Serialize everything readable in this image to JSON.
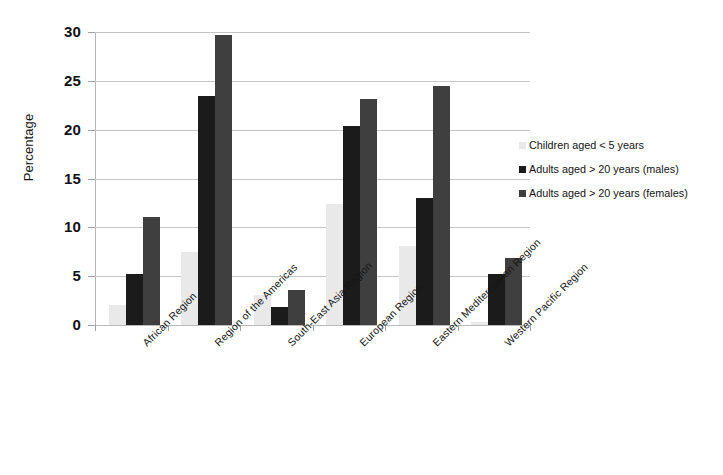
{
  "chart_data": {
    "type": "bar",
    "title": "",
    "xlabel": "",
    "ylabel": "Percentage",
    "ylim": [
      0,
      30
    ],
    "yticks": [
      0,
      5,
      10,
      15,
      20,
      25,
      30
    ],
    "grid": true,
    "legend_position": "right",
    "categories": [
      "African Region",
      "Region of the Americas",
      "South-East Asia Region",
      "European Region",
      "Eastern Mediterranean Region",
      "Western Pacific Region"
    ],
    "series": [
      {
        "name": "Children aged < 5 years",
        "color": "#e9e9e9",
        "values": [
          2.0,
          7.5,
          3.1,
          12.4,
          8.1,
          0.3
        ]
      },
      {
        "name": "Adults aged > 20 years (males)",
        "color": "#1b1b1b",
        "values": [
          5.2,
          23.4,
          1.8,
          20.4,
          13.0,
          5.2
        ]
      },
      {
        "name": "Adults aged > 20 years (females)",
        "color": "#3f3f3f",
        "values": [
          11.1,
          29.7,
          3.6,
          23.1,
          24.5,
          6.9
        ]
      }
    ]
  },
  "axes": {
    "y_title": "Percentage",
    "y_tick_labels": [
      "0",
      "5",
      "10",
      "15",
      "20",
      "25",
      "30"
    ]
  },
  "legend": {
    "entries": [
      {
        "label": "Children aged < 5 years",
        "swatch": "s-children"
      },
      {
        "label": "Adults aged > 20 years (males)",
        "swatch": "s-males"
      },
      {
        "label": "Adults aged > 20 years (females)",
        "swatch": "s-females"
      }
    ]
  },
  "colors": {
    "children": "#e9e9e9",
    "males": "#1b1b1b",
    "females": "#3f3f3f",
    "gridline": "#c3c6c8",
    "text": "#161616"
  }
}
